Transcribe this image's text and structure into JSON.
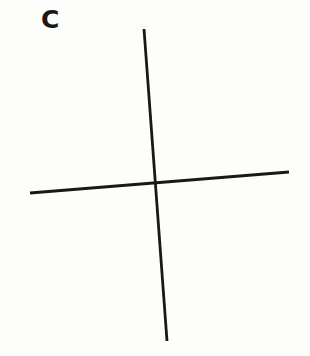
{
  "figure": {
    "panel_label": "C",
    "background_color": "#fdfdfb",
    "ink_color": "#1a1815",
    "width": 310,
    "height": 356
  },
  "chart_data": {
    "type": "line",
    "title": "C",
    "subtitle": "",
    "xlabel": "",
    "ylabel": "",
    "grid": false,
    "legend_position": "none",
    "xlim": [
      0,
      310
    ],
    "ylim": [
      0,
      356
    ],
    "annotations": [
      {
        "text": "C",
        "x": 44,
        "y": 22,
        "bold": true,
        "font_size": 25
      }
    ],
    "series": [
      {
        "name": "vertical-stroke",
        "stroke_color": "#1a1815",
        "stroke_width": 2.8,
        "x": [
          144,
          167
        ],
        "y": [
          29,
          341
        ]
      },
      {
        "name": "horizontal-stroke",
        "stroke_color": "#1a1815",
        "stroke_width": 2.8,
        "x": [
          30,
          289
        ],
        "y": [
          193,
          172
        ]
      }
    ],
    "intersection": {
      "x": 157,
      "y": 187
    }
  },
  "speckles": [
    {
      "x": 14,
      "y": 26,
      "r": 1.1,
      "o": 0.07
    },
    {
      "x": 232,
      "y": 14,
      "r": 1.0,
      "o": 0.08
    },
    {
      "x": 268,
      "y": 33,
      "r": 0.9,
      "o": 0.06
    },
    {
      "x": 30,
      "y": 62,
      "r": 1.2,
      "o": 0.07
    },
    {
      "x": 196,
      "y": 74,
      "r": 0.8,
      "o": 0.06
    },
    {
      "x": 92,
      "y": 104,
      "r": 1.0,
      "o": 0.05
    },
    {
      "x": 246,
      "y": 118,
      "r": 1.1,
      "o": 0.07
    },
    {
      "x": 18,
      "y": 141,
      "r": 0.9,
      "o": 0.06
    },
    {
      "x": 288,
      "y": 148,
      "r": 1.0,
      "o": 0.05
    },
    {
      "x": 62,
      "y": 174,
      "r": 0.8,
      "o": 0.06
    },
    {
      "x": 208,
      "y": 206,
      "r": 1.1,
      "o": 0.07
    },
    {
      "x": 116,
      "y": 228,
      "r": 0.9,
      "o": 0.05
    },
    {
      "x": 262,
      "y": 244,
      "r": 1.0,
      "o": 0.06
    },
    {
      "x": 40,
      "y": 268,
      "r": 1.2,
      "o": 0.07
    },
    {
      "x": 184,
      "y": 286,
      "r": 0.9,
      "o": 0.05
    },
    {
      "x": 98,
      "y": 312,
      "r": 1.0,
      "o": 0.06
    },
    {
      "x": 276,
      "y": 326,
      "r": 0.8,
      "o": 0.05
    },
    {
      "x": 24,
      "y": 338,
      "r": 1.1,
      "o": 0.06
    },
    {
      "x": 150,
      "y": 348,
      "r": 0.9,
      "o": 0.05
    },
    {
      "x": 218,
      "y": 96,
      "r": 0.7,
      "o": 0.05
    }
  ]
}
